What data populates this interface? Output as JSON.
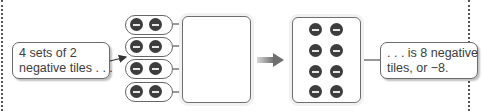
{
  "diagram": {
    "left_callout": {
      "lines": [
        "4 sets of 2",
        "negative tiles . . ."
      ]
    },
    "right_callout": {
      "lines": [
        ". . . is 8 negative",
        "tiles, or −8."
      ]
    },
    "groups": {
      "count": 4,
      "tiles_per_group": 2,
      "tile_symbol": "−",
      "tile_type": "negative"
    },
    "result": {
      "tile_count": 8,
      "tile_symbol": "−",
      "value": "−8"
    },
    "colors": {
      "tile_fill": "#3d3d3d",
      "tile_minus": "#e6e6e6",
      "outline": "#666666",
      "transform_arrow": "#808080"
    }
  }
}
